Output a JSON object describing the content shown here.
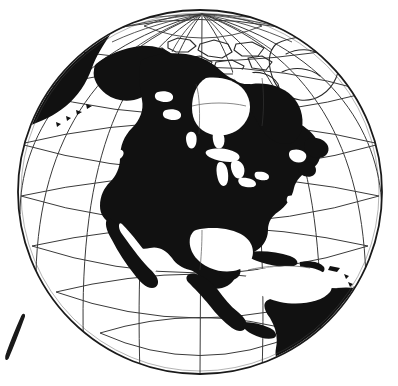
{
  "figure": {
    "title": "Orthographic Globe Projection Centered on North America",
    "caption": "Black-and-white line-art globe showing North America filled solid black with latitude/longitude graticule",
    "alt_text": "Orthographic azimuthal projection of Earth centered near 45N 100W showing North America, Central America, the Caribbean and northern South America as solid black silhouettes on a white sphere overlaid with a latitude and longitude grid.",
    "projection": "orthographic",
    "style": "line-art",
    "width_px": 398,
    "height_px": 386
  },
  "colors": {
    "background": "#ffffff",
    "land_fill": "#111111",
    "graticule_line": "#3a3a3a",
    "limb_line": "#1a1a1a",
    "outline_land": "#2a2a2a",
    "artifact_mark": "#1a1a1a"
  },
  "globe": {
    "center_x": 200,
    "center_y": 192,
    "radius": 182,
    "limb_stroke_width": 1.8,
    "center_latitude": 45,
    "center_longitude": -100,
    "north_pole_screen_x": 202,
    "north_pole_screen_y": 14,
    "label_center": "45°N 100°W",
    "label_pole": "North Pole"
  },
  "graticule": {
    "visible": true,
    "meridian_spacing_deg": 20,
    "parallel_spacing_deg": 15,
    "stroke_width": 1.0,
    "meridian_labels": [
      "180°",
      "160°W",
      "140°W",
      "120°W",
      "100°W",
      "80°W",
      "60°W",
      "40°W",
      "20°W"
    ],
    "parallel_labels": [
      "75°N",
      "60°N",
      "45°N",
      "30°N",
      "15°N",
      "0° Equator",
      "15°S"
    ]
  },
  "landmasses": [
    {
      "name": "North America mainland",
      "fill": "solid-black",
      "region": "center"
    },
    {
      "name": "Alaska",
      "fill": "solid-black",
      "region": "upper-left-limb"
    },
    {
      "name": "Eastern Siberia",
      "fill": "solid-black",
      "region": "far-upper-left-limb"
    },
    {
      "name": "Canadian Arctic Archipelago",
      "fill": "outline",
      "region": "top"
    },
    {
      "name": "Greenland",
      "fill": "outline",
      "region": "upper-right"
    },
    {
      "name": "Baja California",
      "fill": "solid-black",
      "region": "lower-left-center"
    },
    {
      "name": "Central America",
      "fill": "solid-black",
      "region": "lower-center"
    },
    {
      "name": "Cuba",
      "fill": "solid-black",
      "region": "lower-center-right"
    },
    {
      "name": "Hispaniola",
      "fill": "solid-black",
      "region": "lower-center-right"
    },
    {
      "name": "South America (northern)",
      "fill": "solid-black",
      "region": "lower-right-limb"
    },
    {
      "name": "Newfoundland",
      "fill": "solid-black",
      "region": "right-center"
    }
  ],
  "water_features": [
    {
      "name": "Hudson Bay",
      "appearance": "white-void"
    },
    {
      "name": "Great Lakes",
      "appearance": "white-void"
    },
    {
      "name": "Gulf of Mexico",
      "appearance": "white-void"
    },
    {
      "name": "Caribbean Sea",
      "appearance": "white-void"
    },
    {
      "name": "Gulf of California",
      "appearance": "white-void"
    },
    {
      "name": "Pacific Ocean",
      "appearance": "white"
    },
    {
      "name": "Atlantic Ocean",
      "appearance": "white"
    }
  ],
  "artifact": {
    "name": "ink-slash-mark",
    "description": "Small diagonal ink stroke in the lower-left corner outside the globe",
    "x": 6,
    "y": 316,
    "width": 20,
    "height": 44
  }
}
